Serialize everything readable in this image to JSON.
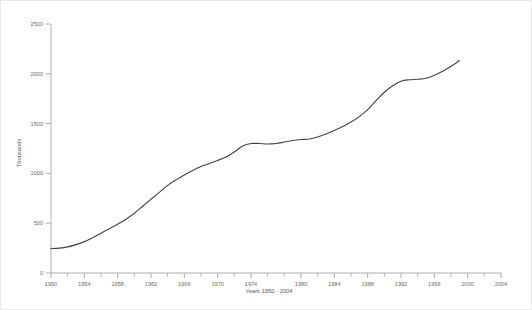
{
  "chart_data": {
    "type": "line",
    "title": "",
    "subtitle": "",
    "xlabel": "Years 1950 - 2004",
    "ylabel": "Thousands",
    "xlim": [
      1950,
      2004
    ],
    "ylim": [
      0,
      2500
    ],
    "grid": false,
    "legend": null,
    "x_ticks_major": [
      1950,
      1954,
      1958,
      1962,
      1966,
      1970,
      1974,
      1980,
      1984,
      1988,
      1992,
      1996,
      2000,
      2004
    ],
    "x_ticks_major_labels": [
      "1950",
      "1954",
      "1958",
      "1962",
      "1966",
      "1970",
      "1974",
      "1980",
      "1984",
      "1988",
      "1992",
      "1996",
      "2000",
      "2004"
    ],
    "x_ticks_minor": [
      1952,
      1956,
      1960,
      1964,
      1968,
      1972,
      1976,
      1978,
      1982,
      1986,
      1990,
      1994,
      1998,
      2002
    ],
    "y_ticks": [
      0,
      500,
      1000,
      1500,
      2000,
      2500
    ],
    "y_tick_labels": [
      "0",
      "500",
      "1000",
      "1500",
      "2000",
      "2500"
    ],
    "line_color": "#444444",
    "series": [
      {
        "name": "",
        "x": [
          1950,
          1951,
          1952,
          1953,
          1954,
          1955,
          1956,
          1957,
          1958,
          1959,
          1960,
          1961,
          1962,
          1963,
          1964,
          1965,
          1966,
          1967,
          1968,
          1969,
          1970,
          1971,
          1972,
          1973,
          1974,
          1975,
          1976,
          1977,
          1978,
          1979,
          1980,
          1981,
          1982,
          1983,
          1984,
          1985,
          1986,
          1987,
          1988,
          1989,
          1990,
          1991,
          1992,
          1993,
          1994,
          1995,
          1996,
          1997,
          1998,
          1999
        ],
        "values": [
          245,
          250,
          262,
          285,
          315,
          355,
          400,
          445,
          490,
          540,
          600,
          670,
          740,
          810,
          880,
          935,
          985,
          1030,
          1070,
          1100,
          1130,
          1165,
          1215,
          1275,
          1300,
          1300,
          1295,
          1300,
          1315,
          1330,
          1340,
          1345,
          1365,
          1395,
          1430,
          1470,
          1515,
          1570,
          1640,
          1730,
          1815,
          1880,
          1925,
          1940,
          1945,
          1955,
          1985,
          2025,
          2075,
          2130
        ]
      }
    ]
  },
  "axis": {
    "y_title": "Thousands",
    "x_title": "Years 1950 - 2004"
  }
}
